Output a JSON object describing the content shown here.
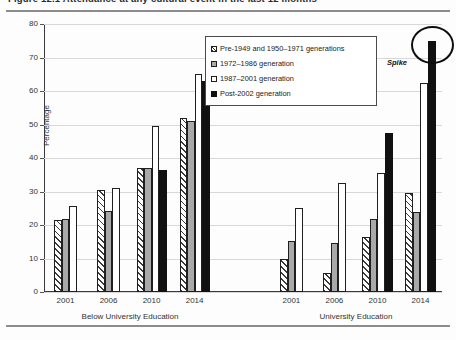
{
  "figure": {
    "title": "Figure 12.1   Attendance at any cultural event in the last 12 months",
    "spike_annotation": "Spike"
  },
  "chart_data": {
    "type": "bar",
    "title": "Figure 12.1   Attendance at any cultural event in the last 12 months",
    "xlabel": "",
    "ylabel": "Percentage",
    "ylim": [
      0,
      80
    ],
    "yticks": [
      0,
      10,
      20,
      30,
      40,
      50,
      60,
      70,
      80
    ],
    "grid": true,
    "legend_position": "upper-center-right",
    "categories": [
      "2001",
      "2006",
      "2010",
      "2014",
      "2001",
      "2006",
      "2010",
      "2014"
    ],
    "group_labels": [
      "Below University Education",
      "University Education"
    ],
    "series": [
      {
        "name": "Pre-1949 and 1950–1971 generations",
        "fill": "diagonal-hatch",
        "values": [
          21.5,
          30.5,
          37.0,
          52.0,
          10.0,
          5.8,
          16.5,
          29.5
        ]
      },
      {
        "name": "1972–1986 generation",
        "fill": "gray",
        "values": [
          21.8,
          24.3,
          37.0,
          51.0,
          15.2,
          14.5,
          21.8,
          24.0
        ]
      },
      {
        "name": "1987–2001 generation",
        "fill": "white",
        "values": [
          25.8,
          31.0,
          49.5,
          65.0,
          25.0,
          32.5,
          35.5,
          62.5
        ]
      },
      {
        "name": "Post-2002 generation",
        "fill": "black",
        "values": [
          null,
          null,
          36.5,
          63.0,
          null,
          null,
          47.5,
          75.0
        ]
      }
    ],
    "annotations": [
      {
        "text": "Spike",
        "target_series": "Post-2002 generation",
        "target_category": "2014",
        "target_group": "University Education"
      }
    ]
  }
}
